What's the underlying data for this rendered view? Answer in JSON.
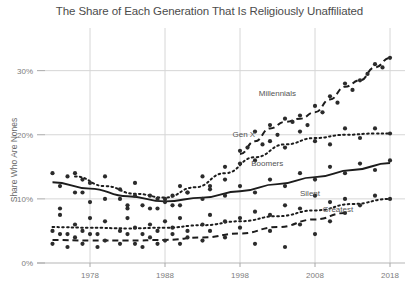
{
  "chart": {
    "title": "The Share of Each Generation That Is Religiously Unaffiliated",
    "ylabel": "Share Who Are Nones",
    "xlabel": ""
  },
  "axes": {
    "y_ticks": [
      "0%",
      "10%",
      "20%",
      "30%"
    ],
    "x_ticks": [
      "1978",
      "1988",
      "1998",
      "2008",
      "2018"
    ]
  },
  "labels": {
    "millennials": "Millennials",
    "genx": "Gen X",
    "boomers": "Boomers",
    "silent": "Silent",
    "greatest": "Greatest"
  },
  "colors": {
    "point": "#2b2b2b",
    "line": "#1c1c1c",
    "grid": "#d6d6d6",
    "text": "#4c4c4c",
    "tick_text": "#7d7d7d"
  },
  "chart_data": {
    "type": "scatter",
    "title": "The Share of Each Generation That Is Religiously Unaffiliated",
    "xlabel": "",
    "ylabel": "Share Who Are Nones",
    "xlim": [
      1972,
      2020
    ],
    "ylim": [
      0,
      34
    ],
    "xticks": [
      1978,
      1988,
      1998,
      2008,
      2018
    ],
    "yticks": [
      0,
      10,
      20,
      30
    ],
    "ytick_labels": [
      "0%",
      "10%",
      "20%",
      "30%"
    ],
    "grid": true,
    "legend": "inline-annotations",
    "annotations": [
      {
        "text": "Millennials",
        "x": 2000.5,
        "y": 26.0
      },
      {
        "text": "Gen X",
        "x": 1997.0,
        "y": 19.6
      },
      {
        "text": "Boomers",
        "x": 1999.5,
        "y": 15.2
      },
      {
        "text": "Silent",
        "x": 2006.0,
        "y": 10.4
      },
      {
        "text": "Greatest",
        "x": 2009.0,
        "y": 8.0
      }
    ],
    "series": [
      {
        "name": "Millennials",
        "linestyle": "dashed",
        "trend": {
          "x": [
            1998,
            2000,
            2002,
            2004,
            2006,
            2008,
            2010,
            2012,
            2014,
            2016,
            2018
          ],
          "y": [
            17.0,
            19.0,
            21.0,
            22.0,
            22.5,
            23.5,
            25.5,
            27.5,
            28.5,
            30.5,
            32.0
          ]
        },
        "points": {
          "x": [
            1996,
            1998,
            1999,
            2000,
            2001,
            2002,
            2003,
            2004,
            2005,
            2006,
            2007,
            2008,
            2009,
            2010,
            2011,
            2012,
            2013,
            2014,
            2015,
            2016,
            2017,
            2018
          ],
          "y": [
            13.0,
            15.5,
            18.0,
            20.5,
            18.5,
            21.5,
            20.0,
            22.5,
            22.0,
            23.0,
            21.5,
            24.5,
            23.5,
            26.0,
            25.0,
            28.0,
            27.0,
            28.5,
            29.5,
            31.0,
            30.5,
            32.0
          ]
        }
      },
      {
        "name": "Gen X",
        "linestyle": "dotted",
        "trend": {
          "x": [
            1976,
            1980,
            1984,
            1988,
            1992,
            1996,
            2000,
            2004,
            2008,
            2012,
            2016,
            2018
          ],
          "y": [
            13.5,
            12.0,
            10.8,
            10.2,
            11.8,
            14.0,
            16.5,
            18.5,
            19.5,
            20.0,
            20.2,
            20.2
          ]
        },
        "points": {
          "x": [
            1974,
            1976,
            1977,
            1978,
            1980,
            1982,
            1983,
            1984,
            1985,
            1986,
            1987,
            1988,
            1989,
            1990,
            1991,
            1993,
            1994,
            1996,
            1998,
            2000,
            2002,
            2004,
            2006,
            2008,
            2010,
            2012,
            2014,
            2016,
            2018
          ],
          "y": [
            8.5,
            14.0,
            11.0,
            9.5,
            13.5,
            10.0,
            8.5,
            12.5,
            9.0,
            10.5,
            8.5,
            10.0,
            9.0,
            12.0,
            11.0,
            13.5,
            12.0,
            15.0,
            17.5,
            16.0,
            19.0,
            18.0,
            20.5,
            19.0,
            18.5,
            21.0,
            19.5,
            21.0,
            20.2
          ]
        }
      },
      {
        "name": "Boomers",
        "linestyle": "solid",
        "trend": {
          "x": [
            1973,
            1978,
            1983,
            1988,
            1993,
            1998,
            2003,
            2008,
            2013,
            2018
          ],
          "y": [
            12.6,
            11.6,
            10.4,
            9.6,
            10.2,
            11.2,
            12.3,
            13.4,
            14.5,
            15.6
          ]
        },
        "points": {
          "x": [
            1973,
            1974,
            1975,
            1976,
            1977,
            1978,
            1980,
            1982,
            1983,
            1984,
            1986,
            1987,
            1988,
            1989,
            1990,
            1991,
            1993,
            1994,
            1996,
            1998,
            2000,
            2002,
            2004,
            2006,
            2008,
            2010,
            2012,
            2014,
            2016,
            2018
          ],
          "y": [
            14.0,
            12.0,
            13.5,
            11.0,
            13.0,
            12.5,
            10.0,
            11.5,
            9.0,
            10.5,
            8.5,
            10.0,
            9.5,
            10.5,
            9.0,
            11.0,
            10.0,
            11.5,
            10.5,
            12.0,
            11.0,
            13.0,
            12.0,
            14.0,
            13.0,
            15.0,
            14.0,
            15.5,
            14.5,
            16.0
          ]
        }
      },
      {
        "name": "Silent",
        "linestyle": "dotted",
        "trend": {
          "x": [
            1973,
            1978,
            1983,
            1988,
            1993,
            1998,
            2003,
            2008,
            2013,
            2018
          ],
          "y": [
            5.6,
            5.5,
            5.4,
            5.5,
            5.9,
            6.5,
            7.3,
            8.2,
            9.2,
            10.0
          ]
        },
        "points": {
          "x": [
            1973,
            1974,
            1975,
            1976,
            1977,
            1978,
            1979,
            1980,
            1982,
            1983,
            1984,
            1985,
            1986,
            1987,
            1988,
            1989,
            1990,
            1991,
            1993,
            1994,
            1996,
            1998,
            2000,
            2002,
            2004,
            2006,
            2008,
            2010,
            2012,
            2014,
            2016,
            2018
          ],
          "y": [
            5.0,
            7.5,
            4.5,
            6.0,
            5.0,
            7.0,
            4.5,
            6.5,
            5.0,
            7.0,
            5.5,
            4.5,
            6.0,
            5.0,
            6.5,
            5.5,
            7.0,
            5.0,
            6.0,
            7.5,
            6.5,
            7.0,
            8.0,
            7.5,
            9.0,
            8.5,
            10.5,
            9.5,
            10.0,
            9.0,
            10.5,
            10.0
          ]
        }
      },
      {
        "name": "Greatest",
        "linestyle": "dashed",
        "trend": {
          "x": [
            1973,
            1978,
            1983,
            1988,
            1993,
            1998,
            2003,
            2008,
            2012
          ],
          "y": [
            3.6,
            3.5,
            3.5,
            3.6,
            4.0,
            4.6,
            5.6,
            6.8,
            7.8
          ]
        },
        "points": {
          "x": [
            1973,
            1974,
            1975,
            1976,
            1977,
            1978,
            1979,
            1980,
            1982,
            1983,
            1984,
            1985,
            1986,
            1987,
            1988,
            1989,
            1990,
            1991,
            1993,
            1994,
            1996,
            1998,
            2000,
            2002,
            2004,
            2006,
            2008,
            2010,
            2012
          ],
          "y": [
            3.0,
            4.5,
            2.5,
            4.0,
            3.0,
            4.5,
            2.5,
            3.5,
            3.0,
            4.5,
            3.0,
            2.5,
            4.0,
            3.0,
            3.5,
            4.5,
            3.0,
            4.0,
            3.5,
            5.0,
            4.0,
            5.5,
            3.0,
            5.0,
            2.5,
            6.0,
            4.5,
            6.5,
            7.8
          ]
        }
      }
    ]
  }
}
